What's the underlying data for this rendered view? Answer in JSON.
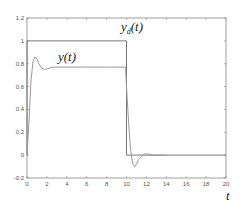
{
  "chart_data": {
    "type": "line",
    "title": "",
    "xlabel": "t",
    "ylabel": "",
    "xlim": [
      0,
      20
    ],
    "ylim": [
      -0.2,
      1.2
    ],
    "grid": false,
    "legend": "inline annotations",
    "x_ticks": [
      "0",
      "2",
      "4",
      "6",
      "8",
      "10",
      "12",
      "14",
      "16",
      "18",
      "20"
    ],
    "y_ticks": [
      "-0.2",
      "0",
      "0.2",
      "0.4",
      "0.6",
      "0.8",
      "1",
      "1.2"
    ],
    "annotations": [
      {
        "text": "y_d(t)",
        "x": 12,
        "y": 1.07
      },
      {
        "text": "y(t)",
        "x": 6,
        "y": 0.83
      }
    ],
    "series": [
      {
        "name": "y_d(t)",
        "x": [
          0,
          0,
          10,
          10,
          20
        ],
        "y": [
          0,
          1,
          1,
          0,
          0
        ]
      },
      {
        "name": "y(t)",
        "x": [
          0,
          0.2,
          0.4,
          0.6,
          0.8,
          1.0,
          1.2,
          1.5,
          1.8,
          2.2,
          2.6,
          3,
          4,
          6,
          8,
          9.9,
          10,
          10.2,
          10.4,
          10.6,
          10.8,
          11.0,
          11.2,
          11.5,
          11.8,
          12.2,
          12.6,
          13,
          13.5,
          14
        ],
        "y": [
          0,
          0.3,
          0.65,
          0.82,
          0.86,
          0.84,
          0.8,
          0.76,
          0.75,
          0.76,
          0.77,
          0.77,
          0.77,
          0.77,
          0.77,
          0.77,
          0.6,
          0.3,
          0.05,
          -0.07,
          -0.1,
          -0.08,
          -0.04,
          -0.01,
          0.01,
          0.01,
          0.0,
          0.0,
          0.0,
          0.0
        ]
      }
    ]
  },
  "labels": {
    "yd_main": "y",
    "yd_sub": "d",
    "yd_arg": "(t)",
    "y_main": "y(t)",
    "x_axis": "t"
  }
}
